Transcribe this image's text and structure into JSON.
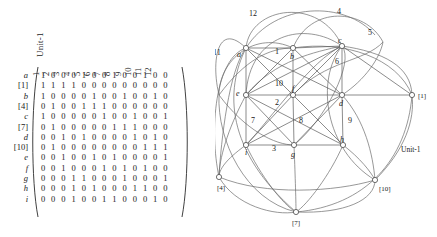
{
  "figure": {
    "title": "Unit-1",
    "matrix": {
      "caption": "Unit-1",
      "column_headers": [
        "1",
        "2",
        "3",
        "4",
        "5",
        "6",
        "7",
        "8",
        "9",
        "10",
        "11",
        "12"
      ],
      "row_labels": [
        "a",
        "[1]",
        "b",
        "[4]",
        "c",
        "[7]",
        "d",
        "[10]",
        "e",
        "f",
        "g",
        "h",
        "i"
      ],
      "rows": [
        {
          "label": "a",
          "values": [
            1,
            0,
            0,
            0,
            1,
            0,
            0,
            1,
            0,
            0,
            1,
            0,
            0
          ]
        },
        {
          "label": "[1]",
          "values": [
            1,
            1,
            1,
            1,
            0,
            0,
            0,
            0,
            0,
            0,
            0,
            0,
            0
          ]
        },
        {
          "label": "b",
          "values": [
            1,
            0,
            0,
            0,
            0,
            1,
            0,
            0,
            1,
            0,
            0,
            1,
            0
          ]
        },
        {
          "label": "[4]",
          "values": [
            0,
            1,
            0,
            0,
            1,
            1,
            1,
            0,
            0,
            0,
            0,
            0,
            0
          ]
        },
        {
          "label": "c",
          "values": [
            1,
            0,
            0,
            0,
            0,
            0,
            1,
            0,
            0,
            1,
            0,
            0,
            1
          ]
        },
        {
          "label": "[7]",
          "values": [
            0,
            1,
            0,
            0,
            0,
            0,
            0,
            1,
            1,
            1,
            0,
            0,
            0
          ]
        },
        {
          "label": "d",
          "values": [
            0,
            0,
            1,
            0,
            1,
            0,
            0,
            0,
            0,
            1,
            0,
            1,
            0
          ]
        },
        {
          "label": "[10]",
          "values": [
            0,
            1,
            0,
            0,
            0,
            0,
            0,
            0,
            0,
            0,
            1,
            1,
            1
          ]
        },
        {
          "label": "e",
          "values": [
            0,
            0,
            1,
            0,
            0,
            1,
            0,
            1,
            0,
            0,
            0,
            0,
            1
          ]
        },
        {
          "label": "f",
          "values": [
            0,
            0,
            1,
            0,
            0,
            0,
            1,
            0,
            1,
            0,
            1,
            0,
            0
          ]
        },
        {
          "label": "g",
          "values": [
            0,
            0,
            0,
            1,
            1,
            0,
            0,
            0,
            1,
            0,
            0,
            0,
            1
          ]
        },
        {
          "label": "h",
          "values": [
            0,
            0,
            0,
            1,
            0,
            1,
            0,
            0,
            0,
            1,
            1,
            0,
            0
          ]
        },
        {
          "label": "i",
          "values": [
            0,
            0,
            0,
            1,
            0,
            0,
            1,
            1,
            0,
            0,
            0,
            1,
            0
          ]
        }
      ]
    },
    "graph": {
      "unit_label": "Unit-1",
      "vertices": [
        {
          "id": "a",
          "label": "a",
          "x": 31,
          "y": 48,
          "label_dx": -9,
          "label_dy": 9,
          "type": "italic"
        },
        {
          "id": "b",
          "label": "b",
          "x": 78,
          "y": 48,
          "label_dx": -3,
          "label_dy": 11,
          "type": "italic"
        },
        {
          "id": "c",
          "label": "c",
          "x": 127,
          "y": 46,
          "label_dx": -4,
          "label_dy": -3,
          "type": "italic"
        },
        {
          "id": "e",
          "label": "e",
          "x": 31,
          "y": 95,
          "label_dx": -10,
          "label_dy": 1,
          "type": "italic"
        },
        {
          "id": "f",
          "label": "f",
          "x": 78,
          "y": 95,
          "label_dx": -1,
          "label_dy": -4,
          "type": "italic"
        },
        {
          "id": "d",
          "label": "d",
          "x": 127,
          "y": 95,
          "label_dx": -3,
          "label_dy": 11,
          "type": "italic"
        },
        {
          "id": "i",
          "label": "i",
          "x": 31,
          "y": 145,
          "label_dx": -1,
          "label_dy": 10,
          "type": "italic"
        },
        {
          "id": "g",
          "label": "g",
          "x": 79,
          "y": 145,
          "label_dx": -3,
          "label_dy": 12,
          "type": "italic"
        },
        {
          "id": "h",
          "label": "h",
          "x": 128,
          "y": 145,
          "label_dx": -3,
          "label_dy": -3,
          "type": "italic"
        },
        {
          "id": "v1",
          "label": "[1]",
          "x": 197,
          "y": 95,
          "label_dx": 6,
          "label_dy": 3,
          "type": "bracket"
        },
        {
          "id": "v4",
          "label": "[4]",
          "x": 4,
          "y": 177,
          "label_dx": -2,
          "label_dy": 13,
          "type": "bracket"
        },
        {
          "id": "v7",
          "label": "[7]",
          "x": 81,
          "y": 212,
          "label_dx": -4,
          "label_dy": 13,
          "type": "bracket"
        },
        {
          "id": "v10",
          "label": "[10]",
          "x": 160,
          "y": 180,
          "label_dx": 4,
          "label_dy": 11,
          "type": "bracket"
        }
      ],
      "edge_labels": [
        {
          "label": "1",
          "x": 60,
          "y": 54
        },
        {
          "label": "2",
          "x": 60,
          "y": 105
        },
        {
          "label": "3",
          "x": 57,
          "y": 151
        },
        {
          "label": "4",
          "x": 122,
          "y": 14
        },
        {
          "label": "5",
          "x": 153,
          "y": 35
        },
        {
          "label": "6",
          "x": 120,
          "y": 64
        },
        {
          "label": "7",
          "x": 36,
          "y": 123
        },
        {
          "label": "8",
          "x": 84,
          "y": 123
        },
        {
          "label": "9",
          "x": 133,
          "y": 123
        },
        {
          "label": "10",
          "x": 60,
          "y": 86
        },
        {
          "label": "11",
          "x": -2,
          "y": 55
        },
        {
          "label": "12",
          "x": 34,
          "y": 16
        }
      ]
    }
  }
}
